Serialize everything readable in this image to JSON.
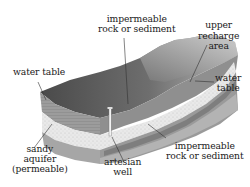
{
  "diagram": {
    "labels": {
      "impermeable_top": {
        "line1": "impermeable",
        "line2": "rock or sediment"
      },
      "upper_recharge": {
        "line1": "upper",
        "line2": "recharge",
        "line3": "area"
      },
      "water_table_left": {
        "line1": "water table"
      },
      "water_table_right": {
        "line1": "water",
        "line2": "table"
      },
      "sandy_aquifer": {
        "line1": "sandy",
        "line2": "aquifer",
        "line3": "(permeable)"
      },
      "artesian_well": {
        "line1": "artesian",
        "line2": "well"
      },
      "impermeable_bottom": {
        "line1": "impermeable",
        "line2": "rock or sediment"
      }
    },
    "colors": {
      "surface_dark": "#555555",
      "surface_mid": "#8a8a8a",
      "surface_light": "#bdbdbd",
      "impermeable_layer": "#9a9a9a",
      "aquifer_layer": "#e6e6e6",
      "lower_impermeable": "#a8a8a8",
      "leader_line": "#333333",
      "text": "#1a1a1a"
    }
  }
}
